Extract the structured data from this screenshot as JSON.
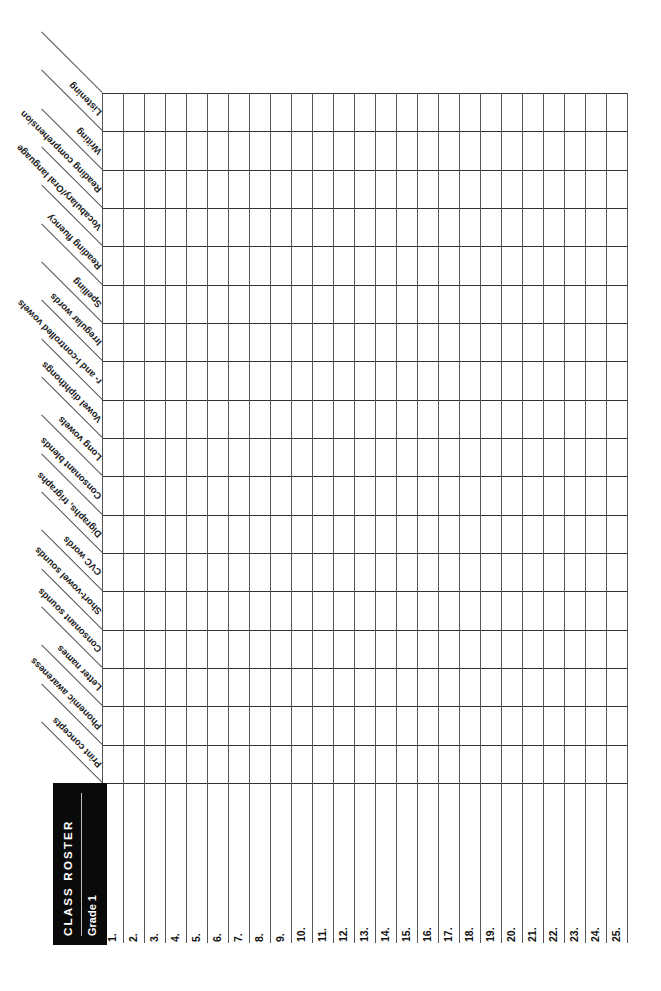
{
  "roster": {
    "title": "CLASS ROSTER",
    "subtitle": "Grade 1",
    "skills": [
      "Listening",
      "Writing",
      "Reading comprehension",
      "Vocabulary/Oral language",
      "Reading fluency",
      "Spelling",
      "Irregular words",
      "r- and l-controlled vowels",
      "Vowel diphthongs",
      "Long vowels",
      "Consonant blends",
      "Digraphs, trigraphs",
      "CVC words",
      "Short-vowel sounds",
      "Consonant sounds",
      "Letter names",
      "Phonemic awareness",
      "Print concepts"
    ],
    "students": [
      "1.",
      "2.",
      "3.",
      "4.",
      "5.",
      "6.",
      "7.",
      "8.",
      "9.",
      "10.",
      "11.",
      "12.",
      "13.",
      "14.",
      "15.",
      "16.",
      "17.",
      "18.",
      "19.",
      "20.",
      "21.",
      "22.",
      "23.",
      "24.",
      "25."
    ]
  },
  "colors": {
    "header_bg": "#0a0a0a",
    "header_text": "#ffffff",
    "grid_line": "#444444"
  }
}
